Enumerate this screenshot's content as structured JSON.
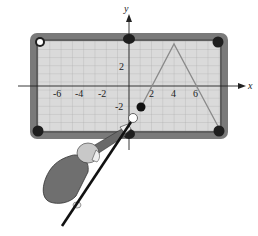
{
  "figure": {
    "axes": {
      "x_label": "x",
      "y_label": "y",
      "x_ticks": [
        "-6",
        "-4",
        "-2",
        "2",
        "4",
        "6"
      ],
      "y_ticks": [
        "2",
        "-2"
      ]
    },
    "path": {
      "start_ball": [
        1,
        -2.5
      ],
      "apex": [
        4,
        5
      ],
      "x_intercepts": [
        2,
        6
      ],
      "end_pocket": [
        8,
        -4
      ]
    },
    "colors": {
      "rail": "#7a7a7a",
      "felt": "#d8d8d8",
      "grid": "#a8a8a8",
      "pocket": "#1e1e1e",
      "path": "#8a8a8a"
    }
  }
}
